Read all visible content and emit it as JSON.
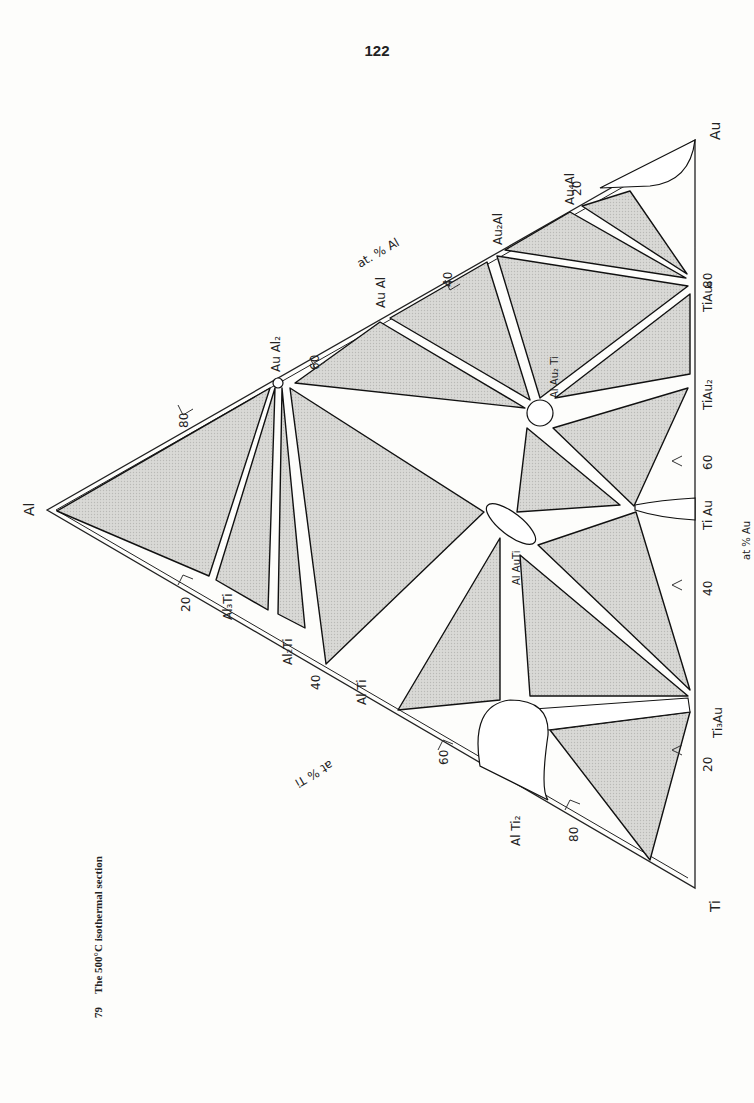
{
  "page": {
    "number": "122"
  },
  "figure": {
    "caption_number": "79",
    "caption_text": "The 500°C isothermal section",
    "system": "Al-Au-Ti",
    "temperature": "500°C"
  },
  "corners": {
    "al": "Al",
    "au": "Au",
    "ti": "Ti"
  },
  "axes": {
    "al_axis": {
      "label": "at. % Al",
      "ticks": [
        "20",
        "40",
        "60",
        "80"
      ]
    },
    "ti_axis": {
      "label": "at. % Ti",
      "ticks": [
        "20",
        "40",
        "60",
        "80"
      ]
    },
    "au_axis": {
      "label": "at. % Au",
      "ticks": [
        "20",
        "40",
        "60",
        "80"
      ]
    }
  },
  "phases": {
    "au_al_side": [
      "Au4Al",
      "Au2Al",
      "AuAl",
      "AuAl2"
    ],
    "al_ti_side": [
      "Al3Ti",
      "Al2Ti",
      "AlTi",
      "AlTi2"
    ],
    "ti_au_side": [
      "Ti3Au",
      "TiAu",
      "TiAu2",
      "TiAu4"
    ],
    "ternary": [
      "AlAu2Ti",
      "AlAuTi"
    ]
  },
  "labels": {
    "au4al": "Au₄Al",
    "au2al": "Au₂Al",
    "aual": "Au Al",
    "aual2": "Au Al₂",
    "al3ti": "Al₃Ti",
    "al2ti": "Al₂Ti",
    "alti": "Al Ti",
    "alti2": "Al Ti₂",
    "ti3au": "Ti₃Au",
    "tiau": "Ti Au",
    "tiau2": "TiAu₂",
    "tiau4": "TiAu₄",
    "alau2ti": "Al Au₂ Ti",
    "alauti": "Al AuTi",
    "at_al": "at. % Al",
    "at_ti": "at % Ti",
    "at_au": "at % Au",
    "t20": "20",
    "t40": "40",
    "t60": "60",
    "t80": "80"
  }
}
